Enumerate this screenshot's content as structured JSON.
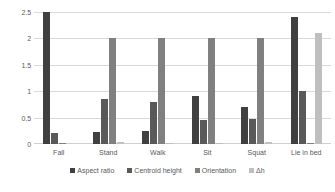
{
  "chart_data": {
    "type": "bar",
    "title": "",
    "xlabel": "",
    "ylabel": "",
    "ylim": [
      0,
      2.5
    ],
    "yticks": [
      "0",
      "0.5",
      "1",
      "1.5",
      "2",
      "2.5"
    ],
    "ytick_values": [
      0,
      0.5,
      1,
      1.5,
      2,
      2.5
    ],
    "grid": true,
    "legend_position": "bottom",
    "categories": [
      "Fall",
      "Stand",
      "Walk",
      "Sit",
      "Squat",
      "Lie in bed"
    ],
    "series": [
      {
        "name": "Aspect ratio",
        "color": "#404040",
        "values": [
          2.5,
          0.22,
          0.25,
          0.9,
          0.7,
          2.4
        ]
      },
      {
        "name": "Centroid height",
        "color": "#595959",
        "values": [
          0.2,
          0.85,
          0.8,
          0.45,
          0.48,
          1.0
        ]
      },
      {
        "name": "Orientation",
        "color": "#808080",
        "values": [
          0.02,
          2.0,
          2.0,
          2.0,
          2.0,
          0.02
        ]
      },
      {
        "name": "Δh",
        "color": "#bfbfbf",
        "values": [
          0.0,
          0.03,
          0.02,
          0.02,
          0.03,
          2.1
        ]
      }
    ]
  }
}
